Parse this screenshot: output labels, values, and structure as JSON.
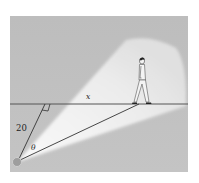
{
  "figure": {
    "type": "geometry diagram",
    "labels": {
      "perpendicular_distance": "20",
      "angle": "θ",
      "horizontal_distance": "x"
    },
    "elements": [
      "light-source",
      "light-beam",
      "ground-line",
      "perpendicular-segment",
      "hypotenuse-segment",
      "right-angle-mark",
      "walking-person"
    ],
    "colors": {
      "background_panel": "#b9b9b9",
      "light_beam": "#f2f2f2",
      "lines": "#333333",
      "light_source": "#9a9a9a"
    }
  }
}
